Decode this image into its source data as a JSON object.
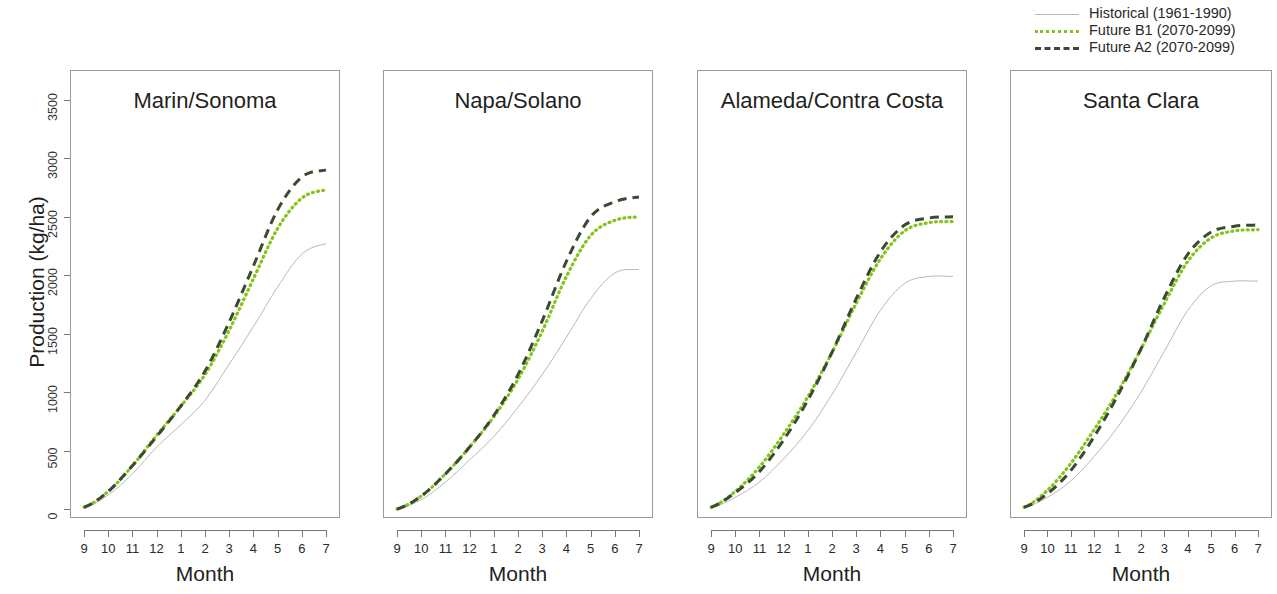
{
  "figure": {
    "ylabel": "Production (kg/ha)",
    "xlabel": "Month",
    "background": "#ffffff"
  },
  "legend": {
    "position": "top-right",
    "entries": [
      {
        "label": "Historical (1961-1990)",
        "key": "hist",
        "color": "#b9b9b9",
        "style": "solid"
      },
      {
        "label": "Future B1 (2070-2099)",
        "key": "b1",
        "color": "#84c318",
        "style": "dotted"
      },
      {
        "label": "Future A2 (2070-2099)",
        "key": "a2",
        "color": "#3b4a33",
        "style": "dashed"
      }
    ]
  },
  "yaxis": {
    "ticks": [
      0,
      500,
      1000,
      1500,
      2000,
      2500,
      3000,
      3500
    ],
    "tick_labels": [
      "0",
      "500",
      "1000",
      "1500",
      "2000",
      "2500",
      "3000",
      "3500"
    ],
    "min": 0,
    "max": 3500
  },
  "xaxis": {
    "ticks": [
      "9",
      "10",
      "11",
      "12",
      "1",
      "2",
      "3",
      "4",
      "5",
      "6",
      "7"
    ],
    "label": "Month"
  },
  "chart_data": {
    "type": "line",
    "title": "",
    "subtitle": "",
    "xlabel": "Month",
    "ylabel": "Production (kg/ha)",
    "ylim": [
      0,
      3500
    ],
    "grid": false,
    "legend_position": "top-right",
    "x": [
      "9",
      "10",
      "11",
      "12",
      "1",
      "2",
      "3",
      "4",
      "5",
      "6",
      "7"
    ],
    "panels": [
      {
        "title": "Marin/Sonoma",
        "series": [
          {
            "name": "Historical (1961-1990)",
            "color": "#b9b9b9",
            "style": "solid",
            "values": [
              10,
              120,
              300,
              530,
              720,
              930,
              1240,
              1560,
              1900,
              2180,
              2270
            ]
          },
          {
            "name": "Future B1 (2070-2099)",
            "color": "#84c318",
            "style": "dotted",
            "values": [
              15,
              150,
              370,
              630,
              880,
              1150,
              1530,
              1970,
              2400,
              2660,
              2730
            ]
          },
          {
            "name": "Future A2 (2070-2099)",
            "color": "#3b4a33",
            "style": "dashed",
            "values": [
              15,
              150,
              370,
              620,
              880,
              1180,
              1600,
              2080,
              2560,
              2840,
              2900
            ]
          }
        ]
      },
      {
        "title": "Napa/Solano",
        "series": [
          {
            "name": "Historical (1961-1990)",
            "color": "#b9b9b9",
            "style": "solid",
            "values": [
              0,
              80,
              230,
              420,
              620,
              870,
              1150,
              1470,
              1800,
              2020,
              2050
            ]
          },
          {
            "name": "Future B1 (2070-2099)",
            "color": "#84c318",
            "style": "dotted",
            "values": [
              0,
              110,
              300,
              530,
              790,
              1110,
              1520,
              1990,
              2340,
              2470,
              2500
            ]
          },
          {
            "name": "Future A2 (2070-2099)",
            "color": "#3b4a33",
            "style": "dashed",
            "values": [
              0,
              110,
              300,
              530,
              800,
              1150,
              1610,
              2120,
              2500,
              2630,
              2670
            ]
          }
        ]
      },
      {
        "title": "Alameda/Contra Costa",
        "series": [
          {
            "name": "Historical (1961-1990)",
            "color": "#b9b9b9",
            "style": "solid",
            "values": [
              10,
              100,
              230,
              430,
              670,
              980,
              1340,
              1700,
              1930,
              1990,
              1990
            ]
          },
          {
            "name": "Future B1 (2070-2099)",
            "color": "#84c318",
            "style": "dotted",
            "values": [
              15,
              150,
              360,
              640,
              960,
              1340,
              1760,
              2140,
              2380,
              2450,
              2460
            ]
          },
          {
            "name": "Future A2 (2070-2099)",
            "color": "#3b4a33",
            "style": "dashed",
            "values": [
              15,
              140,
              320,
              590,
              930,
              1340,
              1800,
              2200,
              2430,
              2490,
              2500
            ]
          }
        ]
      },
      {
        "title": "Santa Clara",
        "series": [
          {
            "name": "Historical (1961-1990)",
            "color": "#b9b9b9",
            "style": "solid",
            "values": [
              10,
              100,
              240,
              450,
              700,
              1000,
              1350,
              1700,
              1910,
              1950,
              1950
            ]
          },
          {
            "name": "Future B1 (2070-2099)",
            "color": "#84c318",
            "style": "dotted",
            "values": [
              15,
              160,
              390,
              680,
              1000,
              1370,
              1760,
              2120,
              2320,
              2380,
              2390
            ]
          },
          {
            "name": "Future A2 (2070-2099)",
            "color": "#3b4a33",
            "style": "dashed",
            "values": [
              15,
              130,
              330,
              620,
              970,
              1370,
              1810,
              2180,
              2370,
              2420,
              2430
            ]
          }
        ]
      }
    ]
  }
}
